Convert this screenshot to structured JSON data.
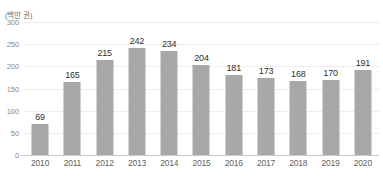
{
  "chart_data": {
    "type": "bar",
    "title": "",
    "subtitle": "",
    "xlabel": "",
    "ylabel": "",
    "unit_label": "(백만 권)",
    "categories": [
      "2010",
      "2011",
      "2012",
      "2013",
      "2014",
      "2015",
      "2016",
      "2017",
      "2018",
      "2019",
      "2020"
    ],
    "values": [
      69,
      165,
      215,
      242,
      234,
      204,
      181,
      173,
      168,
      170,
      191
    ],
    "ylim": [
      0,
      300
    ],
    "yticks": [
      0,
      50,
      100,
      150,
      200,
      250,
      300
    ],
    "ytick_labels": [
      "0",
      "50",
      "100",
      "150",
      "200",
      "250",
      "300"
    ],
    "grid": true,
    "legend": false,
    "data_labels": true,
    "bar_color": "#a8a8a8",
    "gridline_color": "#ededed",
    "axis_color": "#c9c9c9",
    "label_color": "#2f2f2f",
    "tick_color": "#8a8a8a"
  }
}
